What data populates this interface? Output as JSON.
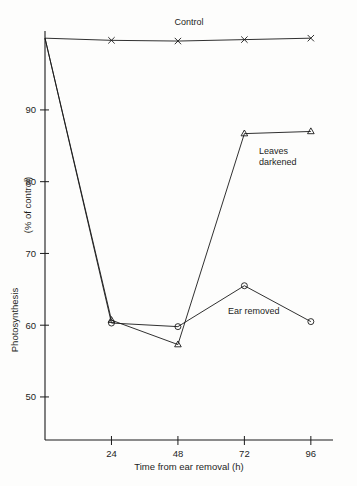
{
  "chart_data": {
    "type": "line",
    "title": "",
    "xlabel": "Time from ear removal (h)",
    "ylabel": "Photosynthesis (% of control)",
    "ylabel_part1": "Photosynthesis",
    "ylabel_part2": "(% of control)",
    "x": [
      0,
      24,
      48,
      72,
      96
    ],
    "xlim": [
      0,
      104
    ],
    "ylim": [
      44,
      101
    ],
    "xticks": [
      24,
      48,
      72,
      96
    ],
    "xtick_labels": [
      "24",
      "48",
      "72",
      "96"
    ],
    "yticks": [
      50,
      60,
      70,
      80,
      90
    ],
    "ytick_labels": [
      "50",
      "60",
      "70",
      "80",
      "90"
    ],
    "grid": false,
    "legend_position": "inline-annotations",
    "series": [
      {
        "name": "Control",
        "label": "Control",
        "marker": "x",
        "x": [
          0,
          24,
          48,
          72,
          96
        ],
        "values": [
          100.0,
          99.7,
          99.6,
          99.8,
          100.0
        ]
      },
      {
        "name": "Leaves darkened",
        "label_line1": "Leaves",
        "label_line2": "darkened",
        "marker": "triangle",
        "x": [
          0,
          24,
          48,
          72,
          96
        ],
        "values": [
          100.0,
          60.7,
          57.3,
          86.7,
          87.0
        ]
      },
      {
        "name": "Ear removed",
        "label": "Ear removed",
        "marker": "circle",
        "x": [
          0,
          24,
          48,
          72,
          96
        ],
        "values": [
          100.0,
          60.3,
          59.8,
          65.5,
          60.5
        ]
      }
    ],
    "annotations": [
      {
        "text": "Control",
        "x": 48,
        "y": 101.5
      },
      {
        "text": "Leaves darkened",
        "x": 76,
        "y": 84
      },
      {
        "text": "Ear removed",
        "x": 66,
        "y": 62.8
      }
    ],
    "colors": {
      "line": "#1a1a1a",
      "axis": "#1a1a1a",
      "background": "#fdfdfc"
    }
  }
}
